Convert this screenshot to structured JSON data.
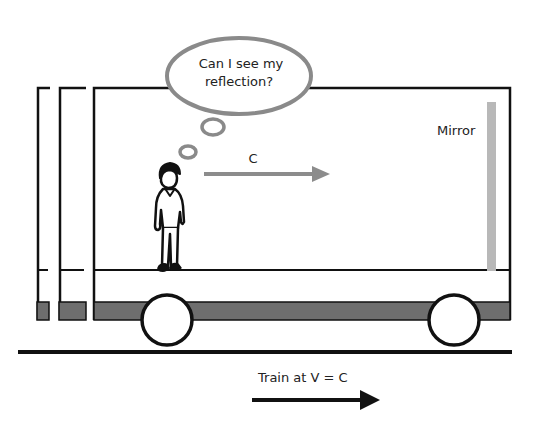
{
  "thought_bubble": {
    "line1": "Can I see my",
    "line2": "reflection?"
  },
  "light_arrow": {
    "label": "C"
  },
  "mirror": {
    "label": "Mirror"
  },
  "train_motion": {
    "label": "Train at V = C"
  },
  "colors": {
    "outline": "#111111",
    "bubble_stroke": "#8a8a8a",
    "light_arrow": "#8c8c8c",
    "mirror": "#b8b8b8",
    "undercarriage": "#6e6e6e",
    "background": "#ffffff"
  }
}
